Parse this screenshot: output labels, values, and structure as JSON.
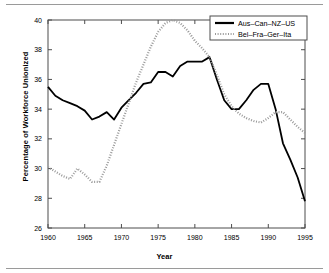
{
  "figure": {
    "xlabel": "Year",
    "ylabel": "Percentage of Workforce Unionized"
  },
  "chart_data": {
    "type": "line",
    "title": "",
    "xlabel": "Year",
    "ylabel": "Percentage of Workforce Unionized",
    "xlim": [
      1960,
      1995
    ],
    "ylim": [
      26,
      40
    ],
    "xticks": [
      1960,
      1965,
      1970,
      1975,
      1980,
      1985,
      1990,
      1995
    ],
    "yticks": [
      26,
      28,
      30,
      32,
      34,
      36,
      38,
      40
    ],
    "grid": false,
    "legend_position": "top-right",
    "x": [
      1960,
      1961,
      1962,
      1963,
      1964,
      1965,
      1966,
      1967,
      1968,
      1969,
      1970,
      1971,
      1972,
      1973,
      1974,
      1975,
      1976,
      1977,
      1978,
      1979,
      1980,
      1981,
      1982,
      1983,
      1984,
      1985,
      1986,
      1987,
      1988,
      1989,
      1990,
      1991,
      1992,
      1993,
      1994,
      1995
    ],
    "series": [
      {
        "name": "Aus-Can-NZ-US",
        "style": "solid",
        "color": "#000000",
        "values": [
          35.5,
          34.9,
          34.6,
          34.4,
          34.2,
          33.9,
          33.3,
          33.5,
          33.8,
          33.3,
          34.1,
          34.6,
          35.1,
          35.7,
          35.8,
          36.5,
          36.5,
          36.2,
          36.9,
          37.2,
          37.2,
          37.2,
          37.5,
          36.0,
          34.6,
          34.0,
          34.0,
          34.6,
          35.3,
          35.7,
          35.7,
          34.0,
          31.7,
          30.6,
          29.4,
          27.8
        ]
      },
      {
        "name": "Bel-Fra-Ger-Ita",
        "style": "dotted",
        "color": "#999999",
        "values": [
          30.1,
          29.8,
          29.5,
          29.3,
          30.0,
          29.6,
          29.1,
          29.1,
          30.2,
          31.6,
          33.0,
          34.4,
          35.8,
          37.0,
          38.2,
          39.2,
          39.8,
          40.0,
          39.8,
          39.3,
          38.6,
          38.1,
          37.5,
          36.3,
          35.0,
          34.2,
          33.7,
          33.4,
          33.2,
          33.1,
          33.4,
          33.8,
          33.8,
          33.3,
          32.8,
          32.4
        ]
      }
    ]
  },
  "legend": {
    "entries": [
      {
        "label": "Aus-Can-NZ-US",
        "style": "solid"
      },
      {
        "label": "Bel-Fra-Ger-Ita",
        "style": "dotted"
      }
    ]
  },
  "colors": {
    "series_1": "#000000",
    "series_2": "#999999",
    "axis": "#4d4d4d",
    "frame": "#9a9a9a",
    "background": "#ffffff"
  }
}
